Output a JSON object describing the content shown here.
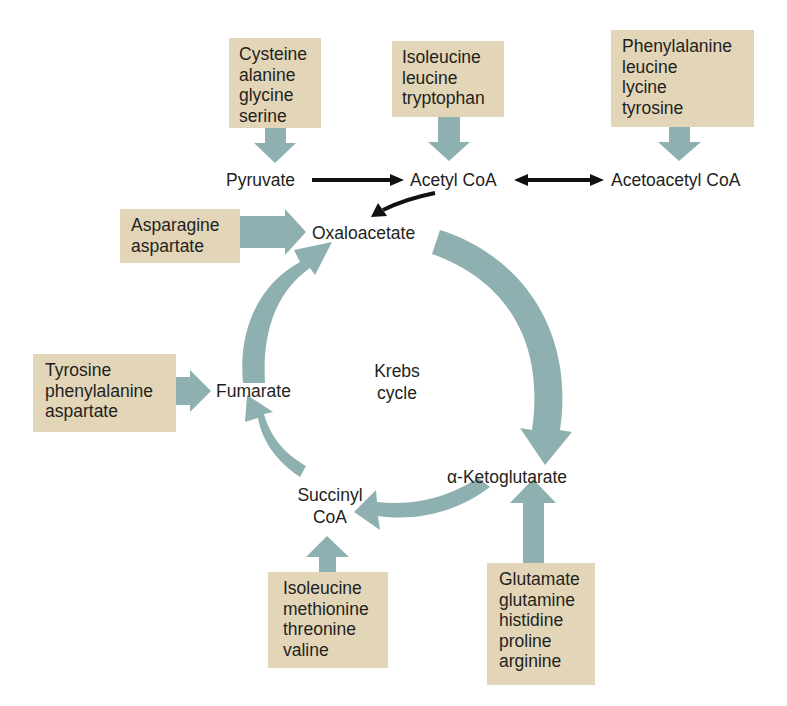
{
  "diagram": {
    "colors": {
      "box_fill": "#e3d6b8",
      "pathway_arrow": "#8fb0b1",
      "black_arrow": "#111111",
      "text": "#231f20"
    },
    "center_label": [
      "Krebs",
      "cycle"
    ],
    "nodes": {
      "pyruvate": "Pyruvate",
      "acetyl_coa": "Acetyl CoA",
      "acetoacetyl_coa": "Acetoacetyl CoA",
      "oxaloacetate": "Oxaloacetate",
      "fumarate": "Fumarate",
      "succinyl_coa": [
        "Succinyl",
        "CoA"
      ],
      "alpha_ketoglutarate": "α-Ketoglutarate"
    },
    "amino_acid_boxes": {
      "to_pyruvate": [
        "Cysteine",
        "alanine",
        "glycine",
        "serine"
      ],
      "to_acetyl_coa": [
        "Isoleucine",
        "leucine",
        "tryptophan"
      ],
      "to_acetoacetyl_coa": [
        "Phenylalanine",
        "leucine",
        "lycine",
        "tyrosine"
      ],
      "to_oxaloacetate": [
        "Asparagine",
        "aspartate"
      ],
      "to_fumarate": [
        "Tyrosine",
        "phenylalanine",
        "aspartate"
      ],
      "to_succinyl_coa": [
        "Isoleucine",
        "methionine",
        "threonine",
        "valine"
      ],
      "to_alpha_ketoglutarate": [
        "Glutamate",
        "glutamine",
        "histidine",
        "proline",
        "arginine"
      ]
    },
    "edges": [
      {
        "from": "Pyruvate",
        "to": "Acetyl CoA",
        "style": "black"
      },
      {
        "from": "Acetyl CoA",
        "to": "Acetoacetyl CoA",
        "style": "black-bidirectional"
      },
      {
        "from": "Acetyl CoA",
        "to": "Oxaloacetate",
        "style": "black-curved"
      },
      {
        "from": "Oxaloacetate",
        "to": "α-Ketoglutarate",
        "style": "cycle"
      },
      {
        "from": "α-Ketoglutarate",
        "to": "Succinyl CoA",
        "style": "cycle"
      },
      {
        "from": "Succinyl CoA",
        "to": "Fumarate",
        "style": "cycle"
      },
      {
        "from": "Fumarate",
        "to": "Oxaloacetate",
        "style": "cycle"
      }
    ]
  }
}
